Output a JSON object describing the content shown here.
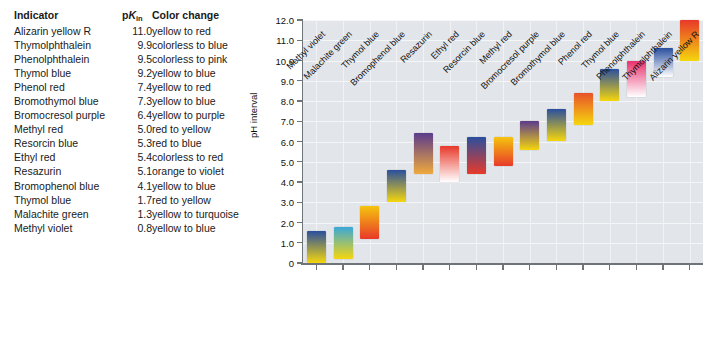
{
  "table": {
    "headers": {
      "indicator": "Indicator",
      "pk_prefix": "p",
      "pk_k": "K",
      "pk_sub": "in",
      "color_change": "Color change"
    },
    "rows": [
      {
        "indicator": "Alizarin yellow R",
        "pk": "11.0",
        "change": "yellow to red"
      },
      {
        "indicator": "Thymolphthalein",
        "pk": "9.9",
        "change": "colorless to blue"
      },
      {
        "indicator": "Phenolphthalein",
        "pk": "9.5",
        "change": "colorless to pink"
      },
      {
        "indicator": "Thymol blue",
        "pk": "9.2",
        "change": "yellow to blue"
      },
      {
        "indicator": "Phenol red",
        "pk": "7.4",
        "change": "yellow to red"
      },
      {
        "indicator": "Bromothymol blue",
        "pk": "7.3",
        "change": "yellow to blue"
      },
      {
        "indicator": "Bromocresol purple",
        "pk": "6.4",
        "change": "yellow to purple"
      },
      {
        "indicator": "Methyl red",
        "pk": "5.0",
        "change": "red to yellow"
      },
      {
        "indicator": "Resorcin blue",
        "pk": "5.3",
        "change": "red to blue"
      },
      {
        "indicator": "Ethyl red",
        "pk": "5.4",
        "change": "colorless to red"
      },
      {
        "indicator": "Resazurin",
        "pk": "5.1",
        "change": "orange to violet"
      },
      {
        "indicator": "Bromophenol blue",
        "pk": "4.1",
        "change": "yellow to blue"
      },
      {
        "indicator": "Thymol blue",
        "pk": "1.7",
        "change": "red to yellow"
      },
      {
        "indicator": "Malachite green",
        "pk": "1.3",
        "change": "yellow to turquoise"
      },
      {
        "indicator": "Methyl violet",
        "pk": "0.8",
        "change": "yellow to blue"
      }
    ]
  },
  "chart_data": {
    "type": "bar",
    "title": "",
    "xlabel": "",
    "ylabel": "pH interval",
    "ylim": [
      0,
      12
    ],
    "yticks": [
      "0",
      "1.0",
      "2.0",
      "3.0",
      "4.0",
      "5.0",
      "6.0",
      "7.0",
      "8.0",
      "9.0",
      "10.0",
      "11.0",
      "12.0"
    ],
    "ytick_values": [
      0,
      1,
      2,
      3,
      4,
      5,
      6,
      7,
      8,
      9,
      10,
      11,
      12
    ],
    "grid": true,
    "legend": "none",
    "categories": [
      "Methyl violet",
      "Malachite green",
      "Thymol blue",
      "Bromophenol blue",
      "Resazurin",
      "Ethyl red",
      "Resorcin blue",
      "Methyl red",
      "Bromocresol purple",
      "Bromothymol blue",
      "Phenol red",
      "Thymol blue",
      "Phenolphthalein",
      "Thymolphthalein",
      "Alizarin yellow R"
    ],
    "bars": [
      {
        "category": "Methyl violet",
        "low": 0.0,
        "high": 1.6,
        "pk": 0.8,
        "top_color": "#2a4f9e",
        "bottom_color": "#f5d60d"
      },
      {
        "category": "Malachite green",
        "low": 0.2,
        "high": 1.8,
        "pk": 1.3,
        "top_color": "#3aa8d8",
        "bottom_color": "#f5d60d"
      },
      {
        "category": "Thymol blue",
        "low": 1.2,
        "high": 2.8,
        "pk": 1.7,
        "top_color": "#f5c40d",
        "bottom_color": "#e8392a"
      },
      {
        "category": "Bromophenol blue",
        "low": 3.0,
        "high": 4.6,
        "pk": 4.1,
        "top_color": "#2a4f9e",
        "bottom_color": "#f5d60d"
      },
      {
        "category": "Resazurin",
        "low": 4.4,
        "high": 6.4,
        "pk": 5.1,
        "top_color": "#5b3b8c",
        "bottom_color": "#f0a93c"
      },
      {
        "category": "Ethyl red",
        "low": 4.0,
        "high": 5.8,
        "pk": 5.4,
        "top_color": "#e8392a",
        "bottom_color": "#ffffff"
      },
      {
        "category": "Resorcin blue",
        "low": 4.4,
        "high": 6.2,
        "pk": 5.3,
        "top_color": "#2a4f9e",
        "bottom_color": "#e8392a"
      },
      {
        "category": "Methyl red",
        "low": 4.8,
        "high": 6.2,
        "pk": 5.0,
        "top_color": "#f5c40d",
        "bottom_color": "#e8392a"
      },
      {
        "category": "Bromocresol purple",
        "low": 5.6,
        "high": 7.0,
        "pk": 6.4,
        "top_color": "#5b3b8c",
        "bottom_color": "#f5d60d"
      },
      {
        "category": "Bromothymol blue",
        "low": 6.0,
        "high": 7.6,
        "pk": 7.3,
        "top_color": "#2a4f9e",
        "bottom_color": "#f5d60d"
      },
      {
        "category": "Phenol red",
        "low": 6.8,
        "high": 8.4,
        "pk": 7.4,
        "top_color": "#e8522a",
        "bottom_color": "#f5d60d"
      },
      {
        "category": "Thymol blue",
        "low": 8.0,
        "high": 9.6,
        "pk": 9.2,
        "top_color": "#2a4f9e",
        "bottom_color": "#f5d60d"
      },
      {
        "category": "Phenolphthalein",
        "low": 8.2,
        "high": 10.0,
        "pk": 9.5,
        "top_color": "#e8326e",
        "bottom_color": "#ffffff"
      },
      {
        "category": "Thymolphthalein",
        "low": 9.2,
        "high": 10.6,
        "pk": 9.9,
        "top_color": "#2a4f9e",
        "bottom_color": "#ffffff"
      },
      {
        "category": "Alizarin yellow R",
        "low": 10.0,
        "high": 12.0,
        "pk": 11.0,
        "top_color": "#e8392a",
        "bottom_color": "#f5d60d"
      }
    ]
  }
}
